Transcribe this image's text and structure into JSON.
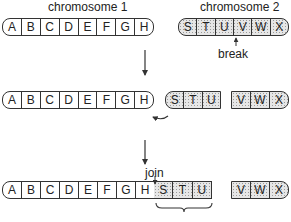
{
  "labels": {
    "chromosome1": "chromosome 1",
    "chromosome2": "chromosome 2",
    "break": "break",
    "join": "join"
  },
  "row1": {
    "chromosome1": [
      "A",
      "B",
      "C",
      "D",
      "E",
      "F",
      "G",
      "H"
    ],
    "chromosome2": [
      "S",
      "T",
      "U",
      "V",
      "W",
      "X"
    ]
  },
  "row2": {
    "chromosome1": [
      "A",
      "B",
      "C",
      "D",
      "E",
      "F",
      "G",
      "H"
    ],
    "fragment_stu": [
      "S",
      "T",
      "U"
    ],
    "fragment_vwx": [
      "V",
      "W",
      "X"
    ]
  },
  "row3": {
    "chromosome1": [
      "A",
      "B",
      "C",
      "D",
      "E",
      "F",
      "G",
      "H"
    ],
    "fragment_stu": [
      "S",
      "T",
      "U"
    ],
    "fragment_vwx": [
      "V",
      "W",
      "X"
    ]
  },
  "colors": {
    "outline": "#333333",
    "shaded_fill": "#e6e6e6",
    "background": "#ffffff"
  }
}
